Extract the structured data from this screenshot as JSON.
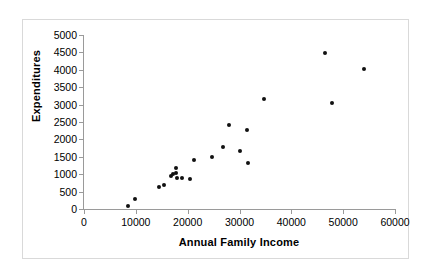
{
  "chart_data": {
    "type": "scatter",
    "title": "",
    "xlabel": "Annual Family Income",
    "ylabel": "Expenditures",
    "xlim": [
      0,
      60000
    ],
    "ylim": [
      0,
      5000
    ],
    "xticks": [
      0,
      10000,
      20000,
      30000,
      40000,
      50000,
      60000
    ],
    "yticks": [
      0,
      500,
      1000,
      1500,
      2000,
      2500,
      3000,
      3500,
      4000,
      4500,
      5000
    ],
    "xtick_labels": [
      "0",
      "10000",
      "20000",
      "30000",
      "40000",
      "50000",
      "60000"
    ],
    "ytick_labels": [
      "0",
      "500",
      "1000",
      "1500",
      "2000",
      "2500",
      "3000",
      "3500",
      "4000",
      "4500",
      "5000"
    ],
    "grid": false,
    "legend": false,
    "marker": "filled-diamond",
    "marker_color": "#111111",
    "series": [
      {
        "name": "Families",
        "points": [
          {
            "x": 8500,
            "y": 100
          },
          {
            "x": 9900,
            "y": 290
          },
          {
            "x": 14400,
            "y": 620
          },
          {
            "x": 15500,
            "y": 690
          },
          {
            "x": 16700,
            "y": 960
          },
          {
            "x": 17200,
            "y": 1000
          },
          {
            "x": 17700,
            "y": 1180
          },
          {
            "x": 17800,
            "y": 1030
          },
          {
            "x": 17900,
            "y": 890
          },
          {
            "x": 18900,
            "y": 880
          },
          {
            "x": 20500,
            "y": 860
          },
          {
            "x": 21200,
            "y": 1400
          },
          {
            "x": 24700,
            "y": 1480
          },
          {
            "x": 26900,
            "y": 1780
          },
          {
            "x": 28000,
            "y": 2420
          },
          {
            "x": 30100,
            "y": 1670
          },
          {
            "x": 31500,
            "y": 2270
          },
          {
            "x": 31700,
            "y": 1310
          },
          {
            "x": 34800,
            "y": 3170
          },
          {
            "x": 46500,
            "y": 4480
          },
          {
            "x": 47900,
            "y": 3040
          },
          {
            "x": 54000,
            "y": 4030
          }
        ]
      }
    ]
  }
}
